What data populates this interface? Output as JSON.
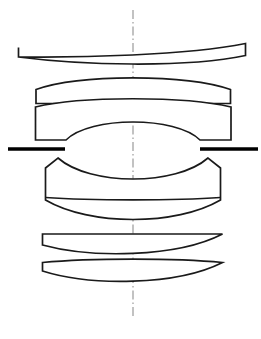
{
  "figure": {
    "kind": "optical-lens-cross-section",
    "title": "",
    "caption": "",
    "background_color": "#ffffff",
    "line_color": "#1a1a1a",
    "axis_color": "#9a9a9a",
    "stop_color": "#000000",
    "canvas": {
      "width": 261,
      "height": 339
    }
  },
  "optical_axis": {
    "name": "optical-axis",
    "orientation": "vertical",
    "x": 133,
    "y_start": 10,
    "y_end": 319,
    "style": "dash-dot",
    "color": "#9a9a9a"
  },
  "aperture_stop": {
    "name": "aperture-stop",
    "y": 149,
    "thickness": 3.4,
    "color": "#000000",
    "left_bar": {
      "x_start": 8,
      "x_end": 65
    },
    "right_bar": {
      "x_start": 200,
      "x_end": 258
    }
  },
  "elements": [
    {
      "id": "L1",
      "name": "lens-element-1",
      "type": "negative-meniscus",
      "semi_diameter": 114,
      "center_thickness": 23,
      "edge_y_top": 47,
      "edge_y_bottom": 57,
      "path": "M 18.5 47.5 L 18.5 57.0 C 80 57.8 185 55.4 245.5 43.5 L 245.5 55.5 C 185 68.2 80 65.0 18.5 57.0 Z",
      "surfaces": [
        {
          "role": "front",
          "shape": "convex",
          "apex_y": 29
        },
        {
          "role": "rear",
          "shape": "convex",
          "apex_y": 52
        }
      ]
    },
    {
      "id": "L2",
      "name": "lens-element-2",
      "type": "negative-meniscus",
      "semi_diameter": 99,
      "center_thickness": 12,
      "edge_y_top": 89,
      "edge_y_bottom": 103,
      "path": "M 36.0 89.5 L 36.0 103.5 L 230.5 103.5 L 230.5 89.5 C 185 74.0 80 74.0 36.0 89.5 Z",
      "surfaces": [
        {
          "role": "front",
          "shape": "convex",
          "apex_y": 63
        },
        {
          "role": "rear",
          "shape": "convex",
          "apex_y": 89
        }
      ]
    },
    {
      "id": "L3",
      "name": "lens-element-3",
      "type": "biconvex",
      "semi_diameter": 99,
      "center_thickness": 68,
      "edge_y_top": 106,
      "edge_y_bottom": 140,
      "path": "M 35.5 107.0 L 35.5 140.0 L 66.0 140.0 C 90 116.0 176 116.0 200.0 140.0 L 231.0 140.0 L 231.0 107.0 C 185 96.0 80 96.0 35.5 107.0 Z",
      "surfaces": [
        {
          "role": "front",
          "shape": "convex",
          "apex_y": 112
        },
        {
          "role": "rear",
          "shape": "convex",
          "apex_y": 181
        }
      ]
    },
    {
      "id": "L4-L5",
      "name": "cemented-doublet",
      "type": "cemented-doublet",
      "semi_diameter": 88,
      "center_thickness": 58,
      "edge_y_top": 168,
      "edge_y_bottom": 200,
      "cemented_surface_y": 198,
      "path": "M 45.5 168.0 L 58.0 158.0 C 90 186.0 176 186.0 208.0 158.0 L 220.5 168.0 L 220.5 200.0 C 176 226.0 90 226.0 45.5 200.0 Z",
      "cement_path": "M 45.5 197.5 C 90 200.6 176 200.6 220.5 197.5",
      "surfaces": [
        {
          "role": "front",
          "shape": "concave",
          "apex_y": 182
        },
        {
          "role": "cemented",
          "shape": "convex",
          "apex_y": 200
        },
        {
          "role": "rear",
          "shape": "convex",
          "apex_y": 226
        }
      ]
    },
    {
      "id": "L6",
      "name": "lens-element-6",
      "type": "negative-meniscus",
      "semi_diameter": 90,
      "center_thickness": 6,
      "edge_y_top": 234,
      "edge_y_bottom": 245,
      "path": "M 42.5 234.0 L 222.5 234.0 C 176 258.0 90 258.0 42.5 245.0 Z",
      "surfaces": [
        {
          "role": "front",
          "shape": "concave",
          "apex_y": 245
        },
        {
          "role": "rear",
          "shape": "concave",
          "apex_y": 252
        }
      ]
    },
    {
      "id": "L7",
      "name": "lens-element-7",
      "type": "biconvex",
      "semi_diameter": 90,
      "center_thickness": 16,
      "edge_y_top": 262,
      "edge_y_bottom": 271,
      "path": "M 42.5 262.5 C 90 258.0 176 258.0 222.5 262.5 C 176 286.0 90 286.0 42.5 271.0 Z",
      "surfaces": [
        {
          "role": "front",
          "shape": "convex",
          "apex_y": 259
        },
        {
          "role": "rear",
          "shape": "convex",
          "apex_y": 285
        }
      ]
    }
  ]
}
